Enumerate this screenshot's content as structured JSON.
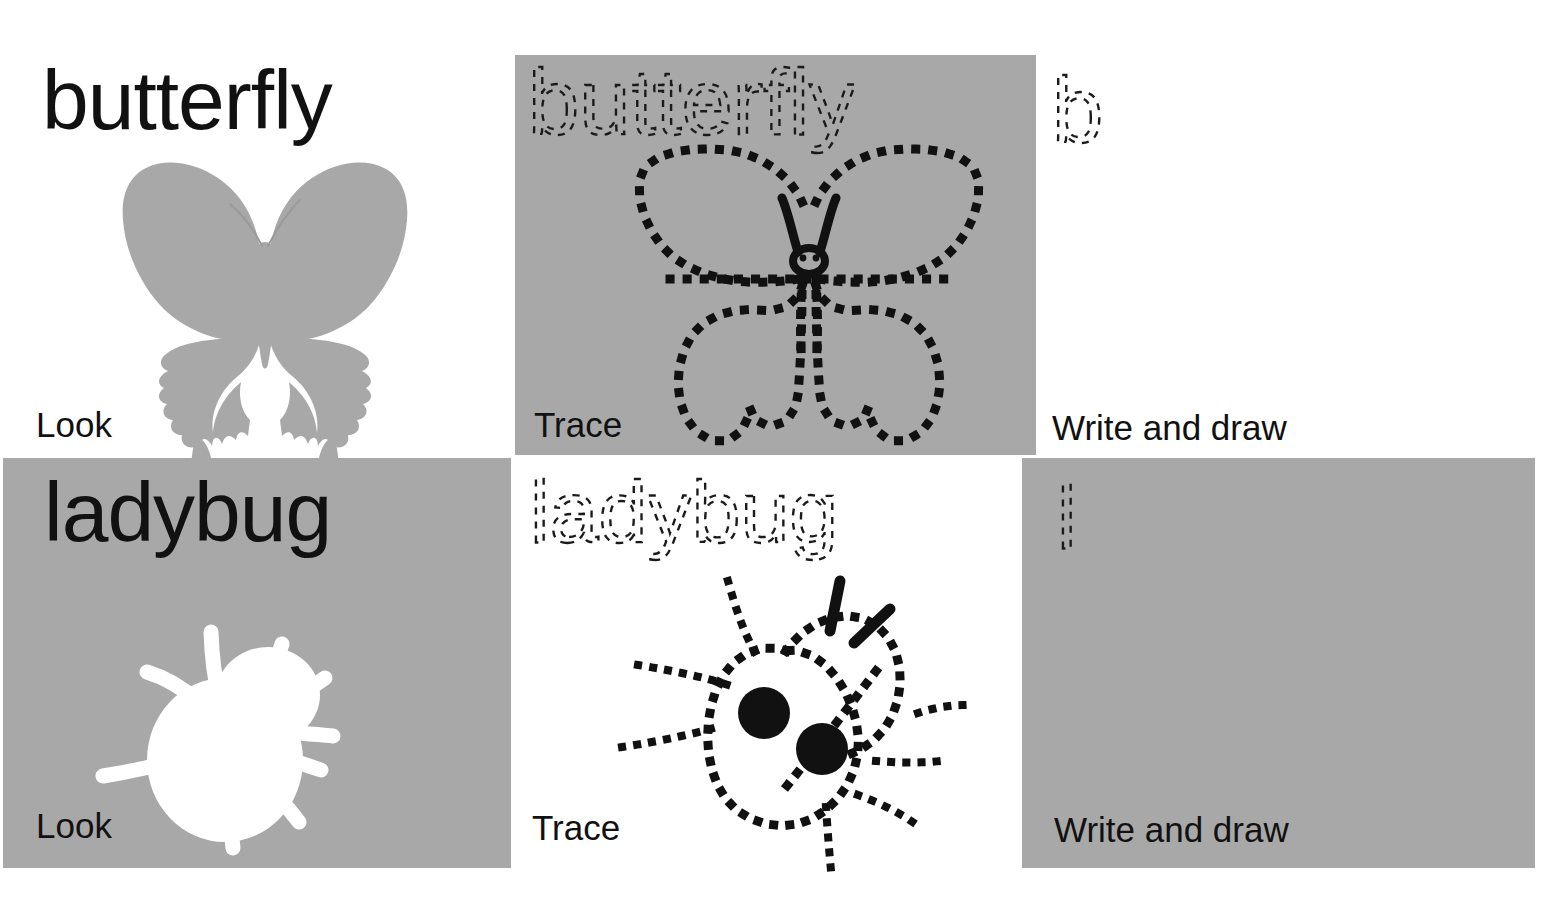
{
  "worksheet": {
    "type": "look-trace-write-and-draw",
    "colors": {
      "panel_gray": "#a8a8a8",
      "page_white": "#ffffff",
      "ink_black": "#111111"
    },
    "columns": [
      {
        "key": "look",
        "caption": "Look"
      },
      {
        "key": "trace",
        "caption": "Trace"
      },
      {
        "key": "write",
        "caption": "Write and draw"
      }
    ],
    "rows": [
      {
        "key": "butterfly",
        "word": "butterfly",
        "trace_word": "butterfly",
        "trace_letter": "b",
        "picture": "butterfly-silhouette",
        "trace_picture": "butterfly-dotted-outline",
        "look_background": "#ffffff",
        "trace_background": "#a8a8a8",
        "write_background": "#ffffff",
        "word_color": "#111111",
        "silhouette_color": "#a8a8a8",
        "captions": {
          "look": "Look",
          "trace": "Trace",
          "write": "Write and draw"
        }
      },
      {
        "key": "ladybug",
        "word": "ladybug",
        "trace_word": "ladybug",
        "trace_letter": "l",
        "picture": "ladybug-silhouette",
        "trace_picture": "ladybug-dotted-outline",
        "look_background": "#a8a8a8",
        "trace_background": "#ffffff",
        "write_background": "#a8a8a8",
        "word_color": "#111111",
        "silhouette_color": "#ffffff",
        "captions": {
          "look": "Look",
          "trace": "Trace",
          "write": "Write and draw"
        }
      }
    ]
  }
}
